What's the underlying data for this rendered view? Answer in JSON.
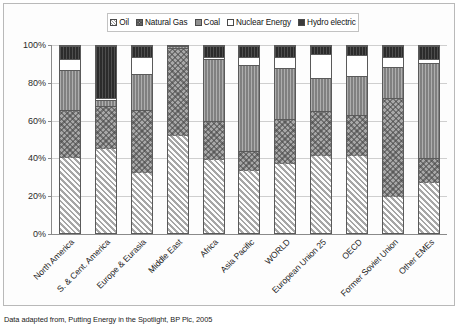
{
  "footnote": "Data adapted from, Putting Energy in the Spotlight, BP Plc, 2005",
  "legend": {
    "items": [
      {
        "label": "Oil",
        "key": "oil",
        "swatch": "oil-swatch-icon",
        "color": "#ececec"
      },
      {
        "label": "Natural Gas",
        "key": "gas",
        "swatch": "natural-gas-swatch-icon",
        "color": "#a8a8a8"
      },
      {
        "label": "Coal",
        "key": "coal",
        "swatch": "coal-swatch-icon",
        "color": "#8f8f8f"
      },
      {
        "label": "Nuclear Energy",
        "key": "nuclear",
        "swatch": "nuclear-swatch-icon",
        "color": "#ffffff"
      },
      {
        "label": "Hydro  electric",
        "key": "hydro",
        "swatch": "hydro-swatch-icon",
        "color": "#3b3b3b"
      }
    ]
  },
  "chart_data": {
    "type": "bar",
    "subtype": "100% stacked column",
    "title": "",
    "xlabel": "",
    "ylabel": "",
    "ylim": [
      0,
      100
    ],
    "ytick_labels": [
      "0%",
      "20%",
      "40%",
      "60%",
      "80%",
      "100%"
    ],
    "ytick_values": [
      0,
      20,
      40,
      60,
      80,
      100
    ],
    "grid": true,
    "legend_position": "top",
    "categories": [
      "North America",
      "S. & Cent. America",
      "Europe & Eurasia",
      "Middle East",
      "Africa",
      "Asia Pacific",
      "WORLD",
      "European Union 25",
      "OECD",
      "Former Soviet Union",
      "Other EMEs"
    ],
    "series": [
      {
        "name": "Oil",
        "values": [
          40,
          45,
          32,
          52,
          39,
          33,
          37,
          41,
          41,
          19,
          27
        ]
      },
      {
        "name": "Natural Gas",
        "values": [
          26,
          23,
          34,
          47,
          21,
          11,
          24,
          24,
          22,
          53,
          13
        ]
      },
      {
        "name": "Coal",
        "values": [
          21,
          3,
          19,
          1,
          33,
          46,
          27,
          18,
          21,
          17,
          51
        ]
      },
      {
        "name": "Nuclear Energy",
        "values": [
          6,
          1,
          9,
          0,
          1,
          4,
          6,
          13,
          11,
          5,
          2
        ]
      },
      {
        "name": "Hydro  electric",
        "values": [
          7,
          28,
          6,
          0,
          6,
          6,
          6,
          4,
          5,
          6,
          7
        ]
      }
    ]
  }
}
